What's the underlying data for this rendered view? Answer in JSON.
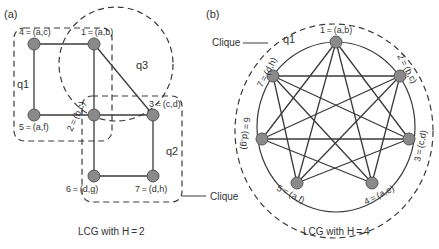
{
  "panel_a": {
    "label": "(a)",
    "caption": "LCG with H = 2",
    "clique_label": "Clique",
    "groups": {
      "q1": "q1",
      "q2": "q2",
      "q3": "q3"
    },
    "nodes": [
      {
        "id": "1",
        "label": "1 = (a,b)"
      },
      {
        "id": "2",
        "label": "2 = (b,c)"
      },
      {
        "id": "3",
        "label": "3 = (c,d)"
      },
      {
        "id": "4",
        "label": "4 = (a,c)"
      },
      {
        "id": "5",
        "label": "5 = (a,f)"
      },
      {
        "id": "6",
        "label": "6 = (d,g)"
      },
      {
        "id": "7",
        "label": "7 = (d,h)"
      }
    ],
    "edges": [
      [
        "4",
        "1"
      ],
      [
        "4",
        "5"
      ],
      [
        "1",
        "2"
      ],
      [
        "1",
        "3"
      ],
      [
        "5",
        "2"
      ],
      [
        "2",
        "3"
      ],
      [
        "2",
        "6"
      ],
      [
        "3",
        "7"
      ],
      [
        "6",
        "7"
      ]
    ]
  },
  "panel_b": {
    "label": "(b)",
    "caption": "LCG with H = 4",
    "clique_label": "Clique",
    "groups": {
      "q1": "q1"
    },
    "nodes": [
      {
        "id": "1",
        "label": "1 = (a,b)"
      },
      {
        "id": "2",
        "label": "2 = (b,c)"
      },
      {
        "id": "3",
        "label": "3 = (c,d)"
      },
      {
        "id": "4",
        "label": "4 = (a,e)"
      },
      {
        "id": "5",
        "label": "5 = (a,f)"
      },
      {
        "id": "6",
        "label": "6 = (d,g)"
      },
      {
        "id": "7",
        "label": "7 = (d,h)"
      }
    ],
    "edges": "complete graph K7 (all pairs connected)"
  },
  "colors": {
    "node_fill": "#8a8a8a",
    "line": "#3a3a3a",
    "text": "#333333",
    "background": "#ffffff"
  }
}
